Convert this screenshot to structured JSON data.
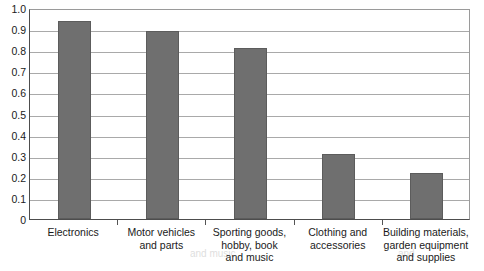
{
  "chart_data": {
    "type": "bar",
    "title": "",
    "xlabel": "",
    "ylabel": "",
    "ylim": [
      0,
      1.0
    ],
    "ytick_labels": [
      "1.0",
      "0.9",
      "0.8",
      "0.7",
      "0.6",
      "0.5",
      "0.4",
      "0.3",
      "0.2",
      "0.1",
      "0"
    ],
    "ytick_values": [
      1.0,
      0.9,
      0.8,
      0.7,
      0.6,
      0.5,
      0.4,
      0.3,
      0.2,
      0.1,
      0
    ],
    "grid": true,
    "legend": "none",
    "bar_color": "#6f6f6f",
    "categories": [
      "Electronics",
      "Motor vehicles and parts",
      "Sporting goods, hobby, book and music",
      "Clothing and accessories",
      "Building materials, garden equipment and supplies"
    ],
    "category_lines": [
      [
        "Electronics"
      ],
      [
        "Motor vehicles",
        "and parts"
      ],
      [
        "Sporting goods,",
        "hobby, book",
        "and music"
      ],
      [
        "Clothing and",
        "accessories"
      ],
      [
        "Building materials,",
        "garden equipment",
        "and supplies"
      ]
    ],
    "values": [
      0.94,
      0.89,
      0.81,
      0.31,
      0.22
    ]
  },
  "artifact": {
    "bleed_line_1": "and music",
    "bleed_line_2": "and"
  }
}
